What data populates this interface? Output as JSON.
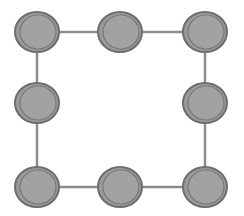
{
  "diagram": {
    "type": "graph",
    "layout": "square-ring",
    "colors": {
      "node_fill": "#9a9a9a",
      "node_stroke": "#6e6e6e",
      "edge": "#8c8c8c",
      "background": "#ffffff"
    },
    "nodes": [
      {
        "id": "n1",
        "cx": 37,
        "cy": 32
      },
      {
        "id": "n2",
        "cx": 120,
        "cy": 32
      },
      {
        "id": "n3",
        "cx": 205,
        "cy": 32
      },
      {
        "id": "n4",
        "cx": 37,
        "cy": 103
      },
      {
        "id": "n5",
        "cx": 205,
        "cy": 103
      },
      {
        "id": "n6",
        "cx": 37,
        "cy": 187
      },
      {
        "id": "n7",
        "cx": 120,
        "cy": 187
      },
      {
        "id": "n8",
        "cx": 205,
        "cy": 187
      }
    ],
    "edges": [
      [
        "n1",
        "n2"
      ],
      [
        "n2",
        "n3"
      ],
      [
        "n3",
        "n5"
      ],
      [
        "n5",
        "n8"
      ],
      [
        "n8",
        "n7"
      ],
      [
        "n7",
        "n6"
      ],
      [
        "n6",
        "n4"
      ],
      [
        "n4",
        "n1"
      ]
    ]
  }
}
